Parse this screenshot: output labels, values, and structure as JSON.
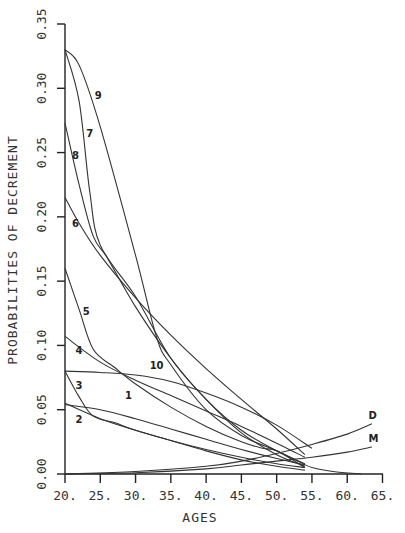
{
  "chart_data": {
    "type": "line",
    "title": "",
    "xlabel": "AGES",
    "ylabel": "PROBABILITIES OF DECREMENT",
    "xlim": [
      20,
      65
    ],
    "ylim": [
      0,
      0.35
    ],
    "grid": false,
    "legend": "inline curve labels",
    "x_ticks": [
      "20.",
      "25.",
      "30.",
      "35.",
      "40.",
      "45.",
      "50.",
      "55.",
      "60.",
      "65."
    ],
    "y_ticks": [
      "0.00",
      "0.05",
      "0.10",
      "0.15",
      "0.20",
      "0.25",
      "0.30",
      "0.35"
    ],
    "series": [
      {
        "name": "1",
        "label_pos": [
          28.5,
          0.058
        ],
        "points": [
          [
            20,
            0.054
          ],
          [
            25,
            0.05
          ],
          [
            30,
            0.043
          ],
          [
            35,
            0.035
          ],
          [
            40,
            0.027
          ],
          [
            45,
            0.019
          ],
          [
            50,
            0.012
          ],
          [
            54,
            0.007
          ]
        ]
      },
      {
        "name": "2",
        "label_pos": [
          21.5,
          0.04
        ],
        "points": [
          [
            20,
            0.055
          ],
          [
            25,
            0.043
          ],
          [
            30,
            0.034
          ],
          [
            35,
            0.026
          ],
          [
            40,
            0.019
          ],
          [
            45,
            0.013
          ],
          [
            50,
            0.008
          ],
          [
            54,
            0.005
          ]
        ]
      },
      {
        "name": "3",
        "label_pos": [
          21.5,
          0.066
        ],
        "points": [
          [
            20,
            0.08
          ],
          [
            22,
            0.06
          ],
          [
            24,
            0.045
          ],
          [
            27,
            0.04
          ],
          [
            30,
            0.034
          ],
          [
            35,
            0.026
          ],
          [
            40,
            0.018
          ],
          [
            45,
            0.011
          ],
          [
            50,
            0.006
          ],
          [
            54,
            0.003
          ]
        ]
      },
      {
        "name": "4",
        "label_pos": [
          21.5,
          0.093
        ],
        "points": [
          [
            20,
            0.107
          ],
          [
            25,
            0.087
          ],
          [
            30,
            0.073
          ],
          [
            35,
            0.061
          ],
          [
            40,
            0.049
          ],
          [
            45,
            0.037
          ],
          [
            50,
            0.024
          ],
          [
            54,
            0.013
          ]
        ]
      },
      {
        "name": "5",
        "label_pos": [
          22.5,
          0.124
        ],
        "points": [
          [
            20,
            0.16
          ],
          [
            22,
            0.128
          ],
          [
            24,
            0.097
          ],
          [
            27,
            0.083
          ],
          [
            30,
            0.07
          ],
          [
            35,
            0.052
          ],
          [
            40,
            0.037
          ],
          [
            45,
            0.025
          ],
          [
            48,
            0.02
          ],
          [
            50,
            0.018
          ],
          [
            54,
            0.005
          ]
        ]
      },
      {
        "name": "6",
        "label_pos": [
          21.0,
          0.192
        ],
        "points": [
          [
            20,
            0.215
          ],
          [
            22,
            0.195
          ],
          [
            25,
            0.17
          ],
          [
            30,
            0.137
          ],
          [
            35,
            0.108
          ],
          [
            40,
            0.082
          ],
          [
            45,
            0.058
          ],
          [
            50,
            0.035
          ],
          [
            54,
            0.015
          ]
        ]
      },
      {
        "name": "7",
        "label_pos": [
          23.0,
          0.262
        ],
        "points": [
          [
            20,
            0.33
          ],
          [
            22,
            0.29
          ],
          [
            23.5,
            0.22
          ],
          [
            25,
            0.178
          ],
          [
            30,
            0.138
          ],
          [
            35,
            0.09
          ],
          [
            40,
            0.058
          ],
          [
            45,
            0.032
          ],
          [
            50,
            0.015
          ],
          [
            54,
            0.006
          ]
        ]
      },
      {
        "name": "8",
        "label_pos": [
          21.0,
          0.245
        ],
        "points": [
          [
            20,
            0.273
          ],
          [
            22,
            0.225
          ],
          [
            24,
            0.185
          ],
          [
            26,
            0.168
          ],
          [
            30,
            0.13
          ],
          [
            35,
            0.09
          ],
          [
            40,
            0.058
          ],
          [
            45,
            0.034
          ],
          [
            50,
            0.018
          ],
          [
            54,
            0.008
          ]
        ]
      },
      {
        "name": "9",
        "label_pos": [
          24.2,
          0.292
        ],
        "points": [
          [
            20,
            0.33
          ],
          [
            22,
            0.318
          ],
          [
            25,
            0.27
          ],
          [
            30,
            0.17
          ],
          [
            33,
            0.106
          ],
          [
            35,
            0.085
          ],
          [
            40,
            0.05
          ],
          [
            45,
            0.03
          ],
          [
            50,
            0.018
          ],
          [
            53,
            0.01
          ],
          [
            55,
            0.005
          ],
          [
            58,
            0.002
          ],
          [
            62,
            0.0
          ]
        ]
      },
      {
        "name": "10",
        "label_pos": [
          32.0,
          0.082
        ],
        "points": [
          [
            20,
            0.08
          ],
          [
            25,
            0.079
          ],
          [
            30,
            0.077
          ],
          [
            35,
            0.072
          ],
          [
            40,
            0.063
          ],
          [
            45,
            0.052
          ],
          [
            50,
            0.038
          ],
          [
            55,
            0.02
          ]
        ]
      },
      {
        "name": "D",
        "label_pos": [
          63.0,
          0.043
        ],
        "points": [
          [
            20,
            0.0
          ],
          [
            30,
            0.002
          ],
          [
            40,
            0.006
          ],
          [
            45,
            0.01
          ],
          [
            50,
            0.016
          ],
          [
            55,
            0.023
          ],
          [
            60,
            0.031
          ],
          [
            63.5,
            0.039
          ]
        ]
      },
      {
        "name": "M",
        "label_pos": [
          63.0,
          0.025
        ],
        "points": [
          [
            20,
            0.0
          ],
          [
            30,
            0.001
          ],
          [
            40,
            0.004
          ],
          [
            45,
            0.007
          ],
          [
            50,
            0.01
          ],
          [
            55,
            0.013
          ],
          [
            60,
            0.017
          ],
          [
            63.5,
            0.021
          ]
        ]
      }
    ]
  }
}
